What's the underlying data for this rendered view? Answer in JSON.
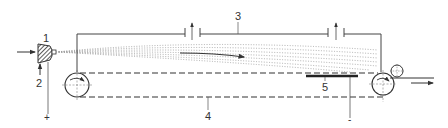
{
  "diagram": {
    "type": "electrospinning-apparatus-schematic",
    "colors": {
      "line": "#333333",
      "spray": "#9a9a9a",
      "background": "#ffffff"
    },
    "labels": {
      "nozzle": "1",
      "gas_inlet": "2",
      "chamber": "3",
      "belt": "4",
      "collector": "5",
      "positive_terminal": "+",
      "negative_terminal": "-"
    },
    "components": [
      {
        "id": "1",
        "name": "nozzle / spinneret"
      },
      {
        "id": "2",
        "name": "gas inlet"
      },
      {
        "id": "3",
        "name": "chamber housing with exhaust vents"
      },
      {
        "id": "4",
        "name": "conveyor belt"
      },
      {
        "id": "5",
        "name": "collector electrode"
      }
    ]
  }
}
